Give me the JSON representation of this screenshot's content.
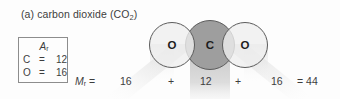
{
  "figure": {
    "label": "(a)",
    "caption_main": "carbon dioxide (CO",
    "caption_sub": "2",
    "caption_close": ")",
    "caption_full": "(a) carbon dioxide (CO2)"
  },
  "ar_box": {
    "title_symbol": "A",
    "title_sub": "r",
    "rows": [
      {
        "element": "C",
        "equals": "=",
        "value": "12"
      },
      {
        "element": "O",
        "equals": "=",
        "value": "16"
      }
    ]
  },
  "molecule": {
    "atoms": [
      {
        "id": "o-left",
        "label": "O",
        "fill": "#efefef"
      },
      {
        "id": "c",
        "label": "C",
        "fill": "#9e9e9e"
      },
      {
        "id": "o-right",
        "label": "O",
        "fill": "#efefef"
      }
    ]
  },
  "equation": {
    "mr_symbol": "M",
    "mr_sub": "r",
    "mr_equals": "=",
    "term_1": "16",
    "plus_1": "+",
    "term_2": "12",
    "plus_2": "+",
    "term_3": "16",
    "total": "= 44"
  },
  "colors": {
    "background": "#fdfdfd",
    "text": "#3d3d3d",
    "atom_oxygen": "#efefef",
    "atom_carbon": "#9e9e9e",
    "outline": "#5c5c5c",
    "box_border": "#8d8d8d"
  }
}
